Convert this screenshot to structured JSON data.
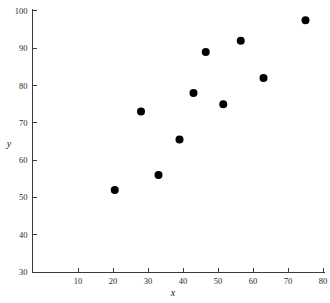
{
  "chart_data": {
    "type": "scatter",
    "title": "",
    "xlabel": "x",
    "ylabel": "y",
    "xlim": [
      0,
      82
    ],
    "ylim": [
      30,
      100
    ],
    "grid": false,
    "legend": null,
    "xticks": [
      10,
      20,
      30,
      40,
      50,
      60,
      70,
      80
    ],
    "yticks": [
      30,
      40,
      50,
      60,
      70,
      80,
      90,
      100
    ],
    "xtick_labels": [
      "10",
      "20",
      "30",
      "40",
      "50",
      "60",
      "70",
      "80"
    ],
    "ytick_labels": [
      "30",
      "40",
      "50",
      "60",
      "70",
      "80",
      "90",
      "100"
    ],
    "marker": "filled-circle",
    "marker_color": "#000000",
    "marker_size": 4,
    "points": [
      {
        "x": 20.5,
        "y": 52
      },
      {
        "x": 28,
        "y": 73
      },
      {
        "x": 33,
        "y": 56
      },
      {
        "x": 39,
        "y": 65.5
      },
      {
        "x": 43,
        "y": 78
      },
      {
        "x": 46.5,
        "y": 89
      },
      {
        "x": 51.5,
        "y": 75
      },
      {
        "x": 56.5,
        "y": 92
      },
      {
        "x": 63,
        "y": 82
      },
      {
        "x": 75,
        "y": 97.5
      }
    ],
    "series": [
      {
        "name": "",
        "x": [
          20.5,
          28,
          33,
          39,
          43,
          46.5,
          51.5,
          56.5,
          63,
          75
        ],
        "values": [
          52,
          73,
          56,
          65.5,
          78,
          89,
          75,
          92,
          82,
          97.5
        ]
      }
    ]
  },
  "axes": {
    "y_axis_title": "y",
    "x_axis_title": "x"
  }
}
